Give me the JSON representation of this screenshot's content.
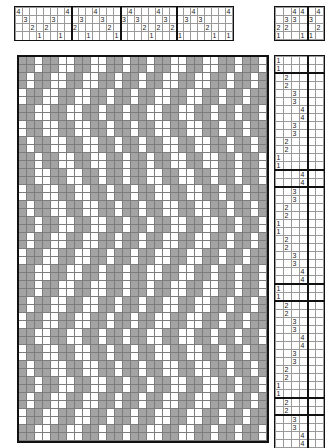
{
  "draft": {
    "title": "Weaving Draft",
    "shaft_labels": [
      "4",
      "3",
      "2",
      "1"
    ],
    "treadle_count": 6,
    "shaft_count": 4,
    "colors": {
      "warp_up": "#a3a3a3",
      "weft_up": "#ffffff",
      "grid_line": "#7d7d7d",
      "border": "#111111",
      "text": "#1a1a1a"
    }
  },
  "threading": {
    "name": "threading-draft",
    "rows": 4,
    "columns": 31,
    "row_labels": [
      "4",
      "3",
      "2",
      "1"
    ],
    "repeat_marks": [
      8,
      15,
      23
    ],
    "sequence": [
      4,
      3,
      2,
      1,
      2,
      3,
      2,
      1,
      4,
      2,
      3,
      2,
      1,
      3,
      4,
      2,
      3,
      1,
      2,
      3,
      4,
      1,
      2,
      3,
      2,
      1,
      4,
      3,
      2,
      1,
      4
    ],
    "cells": [
      [
        "4",
        "",
        "",
        "",
        "",
        "",
        "",
        "4",
        "",
        "",
        "",
        "4",
        "",
        "",
        "",
        "",
        "4",
        "",
        "",
        "",
        "4",
        "",
        "",
        "",
        "",
        "4",
        "",
        "",
        "",
        "",
        "4"
      ],
      [
        "",
        "3",
        "",
        "",
        "",
        "3",
        "",
        "",
        "",
        "3",
        "",
        "",
        "3",
        "",
        "",
        "3",
        "",
        "3",
        "",
        "",
        "",
        "3",
        "",
        "",
        "3",
        "",
        "3",
        "",
        "",
        "",
        ""
      ],
      [
        "",
        "",
        "2",
        "",
        "2",
        "",
        "",
        "",
        "2",
        "",
        "",
        "",
        "",
        "2",
        "",
        "",
        "",
        "",
        "2",
        "",
        "2",
        "",
        "2",
        "",
        "",
        "",
        "",
        "2",
        "",
        "",
        ""
      ],
      [
        "",
        "",
        "",
        "1",
        "",
        "",
        "1",
        "",
        "",
        "",
        "1",
        "",
        "",
        "",
        "1",
        "",
        "",
        "",
        "",
        "1",
        "",
        "",
        "",
        "1",
        "",
        "",
        "",
        "",
        "1",
        "",
        "1"
      ]
    ]
  },
  "tieup": {
    "name": "tie-up-grid",
    "rows": 4,
    "columns": 6,
    "row_labels": [
      "4",
      "3",
      "2",
      "1"
    ],
    "separators": [
      4
    ],
    "cells": [
      [
        "",
        "",
        "4",
        "4",
        "",
        "4"
      ],
      [
        "",
        "3",
        "3",
        "",
        "3",
        ""
      ],
      [
        "2",
        "2",
        "",
        "",
        "",
        "2"
      ],
      [
        "1",
        "",
        "",
        "1",
        "1",
        ""
      ]
    ]
  },
  "treadling": {
    "name": "treadling-draft",
    "rows": 48,
    "columns": 6,
    "separators": [
      4
    ],
    "group_breaks": [
      2,
      14,
      16,
      28,
      30,
      42,
      44
    ],
    "cells": [
      [
        "1",
        "",
        "",
        "",
        "",
        ""
      ],
      [
        "1",
        "",
        "",
        "",
        "",
        ""
      ],
      [
        "",
        "2",
        "",
        "",
        "",
        ""
      ],
      [
        "",
        "2",
        "",
        "",
        "",
        ""
      ],
      [
        "",
        "",
        "3",
        "",
        "",
        ""
      ],
      [
        "",
        "",
        "3",
        "",
        "",
        ""
      ],
      [
        "",
        "",
        "",
        "4",
        "",
        ""
      ],
      [
        "",
        "",
        "",
        "4",
        "",
        ""
      ],
      [
        "",
        "",
        "3",
        "",
        "",
        ""
      ],
      [
        "",
        "",
        "3",
        "",
        "",
        ""
      ],
      [
        "",
        "2",
        "",
        "",
        "",
        ""
      ],
      [
        "",
        "2",
        "",
        "",
        "",
        ""
      ],
      [
        "1",
        "",
        "",
        "",
        "",
        ""
      ],
      [
        "1",
        "",
        "",
        "",
        "",
        ""
      ],
      [
        "",
        "",
        "",
        "4",
        "",
        ""
      ],
      [
        "",
        "",
        "",
        "4",
        "",
        ""
      ],
      [
        "",
        "",
        "3",
        "",
        "",
        ""
      ],
      [
        "",
        "",
        "3",
        "",
        "",
        ""
      ],
      [
        "",
        "2",
        "",
        "",
        "",
        ""
      ],
      [
        "",
        "2",
        "",
        "",
        "",
        ""
      ],
      [
        "1",
        "",
        "",
        "",
        "",
        ""
      ],
      [
        "1",
        "",
        "",
        "",
        "",
        ""
      ],
      [
        "",
        "2",
        "",
        "",
        "",
        ""
      ],
      [
        "",
        "2",
        "",
        "",
        "",
        ""
      ],
      [
        "",
        "",
        "3",
        "",
        "",
        ""
      ],
      [
        "",
        "",
        "3",
        "",
        "",
        ""
      ],
      [
        "",
        "",
        "",
        "4",
        "",
        ""
      ],
      [
        "",
        "",
        "",
        "4",
        "",
        ""
      ],
      [
        "1",
        "",
        "",
        "",
        "",
        ""
      ],
      [
        "1",
        "",
        "",
        "",
        "",
        ""
      ],
      [
        "",
        "2",
        "",
        "",
        "",
        ""
      ],
      [
        "",
        "2",
        "",
        "",
        "",
        ""
      ],
      [
        "",
        "",
        "3",
        "",
        "",
        ""
      ],
      [
        "",
        "",
        "3",
        "",
        "",
        ""
      ],
      [
        "",
        "",
        "",
        "4",
        "",
        ""
      ],
      [
        "",
        "",
        "",
        "4",
        "",
        ""
      ],
      [
        "",
        "",
        "3",
        "",
        "",
        ""
      ],
      [
        "",
        "",
        "3",
        "",
        "",
        ""
      ],
      [
        "",
        "2",
        "",
        "",
        "",
        ""
      ],
      [
        "",
        "2",
        "",
        "",
        "",
        ""
      ],
      [
        "1",
        "",
        "",
        "",
        "",
        ""
      ],
      [
        "1",
        "",
        "",
        "",
        "",
        ""
      ],
      [
        "",
        "2",
        "",
        "",
        "",
        ""
      ],
      [
        "",
        "2",
        "",
        "",
        "",
        ""
      ],
      [
        "",
        "",
        "3",
        "",
        "",
        ""
      ],
      [
        "",
        "",
        "3",
        "",
        "",
        ""
      ],
      [
        "",
        "",
        "",
        "4",
        "",
        ""
      ],
      [
        "",
        "",
        "",
        "4",
        "",
        ""
      ]
    ]
  },
  "drawdown": {
    "name": "drawdown-pattern",
    "columns": 31,
    "rows": 48,
    "legend": {
      "filled": "warp thread on top",
      "empty": "weft thread on top"
    },
    "grid": [
      "1101100110011011011001100110110",
      "1101100110011011011001100110110",
      "1011001100110110110011001101101",
      "1011001100110110110011001101101",
      "0110011001101101100110011011011",
      "0110011001101101100110011011011",
      "1100110011011011001100110110110",
      "1100110011011011001100110110110",
      "0110011001101101100110011011011",
      "0110011001101101100110011011011",
      "1011001100110110110011001101101",
      "1011001100110110110011001101101",
      "1101100110011011011001100110110",
      "1101100110011011011001100110110",
      "1100110011011011001100110110110",
      "1100110011011011001100110110110",
      "0110011001101101100110011011011",
      "0110011001101101100110011011011",
      "1011001100110110110011001101101",
      "1011001100110110110011001101101",
      "1101100110011011011001100110110",
      "1101100110011011011001100110110",
      "1011001100110110110011001101101",
      "1011001100110110110011001101101",
      "0110011001101101100110011011011",
      "0110011001101101100110011011011",
      "1100110011011011001100110110110",
      "1100110011011011001100110110110",
      "1101100110011011011001100110110",
      "1101100110011011011001100110110",
      "1011001100110110110011001101101",
      "1011001100110110110011001101101",
      "0110011001101101100110011011011",
      "0110011001101101100110011011011",
      "1100110011011011001100110110110",
      "1100110011011011001100110110110",
      "0110011001101101100110011011011",
      "0110011001101101100110011011011",
      "1011001100110110110011001101101",
      "1011001100110110110011001101101",
      "1101100110011011011001100110110",
      "1101100110011011011001100110110",
      "1011001100110110110011001101101",
      "1011001100110110110011001101101",
      "0110011001101101100110011011011",
      "0110011001101101100110011011011",
      "1100110011011011001100110110110",
      "1100110011011011001100110110110"
    ]
  }
}
